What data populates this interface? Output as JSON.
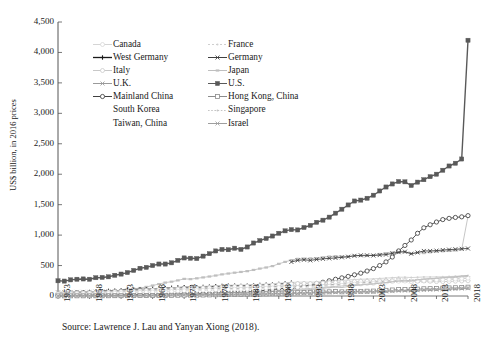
{
  "chart_data": {
    "type": "line",
    "title": "",
    "xlabel": "",
    "ylabel": "US$ billion, in 2016 prices",
    "xlim": [
      1953,
      2018
    ],
    "ylim": [
      0,
      4500
    ],
    "ytick_labels": [
      "0",
      "500",
      "1,000",
      "1,500",
      "2,000",
      "2,500",
      "3,000",
      "3,500",
      "4,000",
      "4,500"
    ],
    "ytick_values": [
      0,
      500,
      1000,
      1500,
      2000,
      2500,
      3000,
      3500,
      4000,
      4500
    ],
    "xtick_labels": [
      "1953",
      "1958",
      "1963",
      "1968",
      "1973",
      "1978",
      "1983",
      "1988",
      "1993",
      "1998",
      "2003",
      "2008",
      "2013",
      "2018"
    ],
    "xtick_values": [
      1953,
      1958,
      1963,
      1968,
      1973,
      1978,
      1983,
      1988,
      1993,
      1998,
      2003,
      2008,
      2013,
      2018
    ],
    "grid": false,
    "legend_position": "upper-left-inside",
    "x": [
      1953,
      1954,
      1955,
      1956,
      1957,
      1958,
      1959,
      1960,
      1961,
      1962,
      1963,
      1964,
      1965,
      1966,
      1967,
      1968,
      1969,
      1970,
      1971,
      1972,
      1973,
      1974,
      1975,
      1976,
      1977,
      1978,
      1979,
      1980,
      1981,
      1982,
      1983,
      1984,
      1985,
      1986,
      1987,
      1988,
      1989,
      1990,
      1991,
      1992,
      1993,
      1994,
      1995,
      1996,
      1997,
      1998,
      1999,
      2000,
      2001,
      2002,
      2003,
      2004,
      2005,
      2006,
      2007,
      2008,
      2009,
      2010,
      2011,
      2012,
      2013,
      2014,
      2015,
      2016,
      2017,
      2018
    ],
    "series": [
      {
        "name": "U.S.",
        "marker": "filled-square",
        "color": "#595959",
        "values": [
          250,
          245,
          265,
          275,
          280,
          275,
          300,
          305,
          315,
          340,
          360,
          385,
          420,
          455,
          470,
          500,
          525,
          525,
          545,
          585,
          625,
          620,
          615,
          655,
          695,
          740,
          765,
          760,
          785,
          765,
          805,
          870,
          910,
          945,
          985,
          1030,
          1070,
          1090,
          1085,
          1125,
          1160,
          1210,
          1245,
          1295,
          1360,
          1425,
          1495,
          1560,
          1575,
          1605,
          1655,
          1725,
          1790,
          1840,
          1880,
          1875,
          1815,
          1870,
          1910,
          1960,
          2000,
          2065,
          2135,
          2180,
          2250,
          4200
        ]
      },
      {
        "name": "Japan",
        "marker": "light-dash",
        "color": "#bfbfbf",
        "values": [
          30,
          34,
          38,
          43,
          48,
          52,
          59,
          68,
          78,
          86,
          96,
          109,
          118,
          131,
          149,
          172,
          196,
          220,
          235,
          256,
          281,
          277,
          290,
          305,
          320,
          336,
          355,
          369,
          383,
          395,
          408,
          428,
          450,
          468,
          491,
          528,
          560,
          590,
          610,
          615,
          618,
          622,
          635,
          648,
          655,
          648,
          648,
          662,
          658,
          660,
          672,
          690,
          702,
          715,
          730,
          720,
          690,
          710,
          705,
          718,
          730,
          735,
          740,
          748,
          765,
          1310
        ]
      },
      {
        "name": "Mainland China",
        "marker": "open-circle",
        "color": "#404040",
        "values": [
          11,
          12,
          13,
          15,
          16,
          16,
          17,
          17,
          14,
          14,
          16,
          18,
          20,
          22,
          21,
          22,
          24,
          28,
          30,
          31,
          33,
          34,
          37,
          37,
          40,
          45,
          49,
          53,
          56,
          60,
          66,
          74,
          84,
          93,
          105,
          119,
          124,
          129,
          139,
          159,
          182,
          205,
          226,
          250,
          275,
          298,
          322,
          348,
          375,
          410,
          450,
          500,
          560,
          640,
          740,
          830,
          920,
          1030,
          1120,
          1170,
          1215,
          1255,
          1275,
          1290,
          1300,
          1320
        ]
      },
      {
        "name": "Germany",
        "marker": "x",
        "color": "#3f3f3f",
        "values": [
          null,
          null,
          null,
          null,
          null,
          null,
          null,
          null,
          null,
          null,
          null,
          null,
          null,
          null,
          null,
          null,
          null,
          null,
          null,
          null,
          null,
          null,
          null,
          null,
          null,
          null,
          null,
          null,
          null,
          null,
          null,
          null,
          null,
          null,
          null,
          null,
          null,
          560,
          585,
          595,
          585,
          600,
          610,
          618,
          625,
          635,
          645,
          660,
          668,
          668,
          665,
          672,
          680,
          700,
          720,
          728,
          695,
          715,
          740,
          740,
          745,
          755,
          762,
          768,
          775,
          780
        ]
      },
      {
        "name": "West Germany",
        "marker": "plus",
        "color": "#1a1a1a",
        "values": [
          45,
          50,
          56,
          60,
          64,
          66,
          72,
          79,
          84,
          88,
          92,
          99,
          105,
          108,
          108,
          114,
          122,
          130,
          134,
          139,
          144,
          145,
          143,
          149,
          154,
          159,
          166,
          168,
          169,
          167,
          171,
          177,
          182,
          186,
          189,
          196,
          206,
          218,
          null,
          null,
          null,
          null,
          null,
          null,
          null,
          null,
          null,
          null,
          null,
          null,
          null,
          null,
          null,
          null,
          null,
          null,
          null,
          null,
          null,
          null,
          null,
          null,
          null,
          null,
          null,
          null
        ]
      },
      {
        "name": "U.K.",
        "marker": "x",
        "color": "#9a9a9a",
        "values": [
          60,
          63,
          66,
          67,
          68,
          68,
          71,
          75,
          77,
          78,
          82,
          87,
          90,
          92,
          94,
          98,
          100,
          103,
          105,
          110,
          118,
          116,
          115,
          118,
          121,
          126,
          130,
          127,
          125,
          128,
          133,
          136,
          141,
          147,
          153,
          161,
          164,
          165,
          162,
          162,
          166,
          173,
          178,
          183,
          190,
          196,
          202,
          210,
          215,
          220,
          229,
          235,
          243,
          250,
          256,
          253,
          243,
          246,
          250,
          254,
          260,
          268,
          275,
          280,
          288,
          292
        ]
      },
      {
        "name": "France",
        "marker": "light-dot",
        "color": "#d0d0d0",
        "values": [
          52,
          55,
          59,
          63,
          67,
          69,
          71,
          76,
          80,
          85,
          89,
          95,
          99,
          104,
          109,
          114,
          122,
          128,
          134,
          140,
          148,
          152,
          152,
          158,
          163,
          168,
          174,
          178,
          180,
          182,
          184,
          187,
          191,
          196,
          201,
          210,
          218,
          224,
          226,
          228,
          226,
          231,
          236,
          240,
          246,
          254,
          262,
          270,
          275,
          278,
          281,
          288,
          294,
          301,
          308,
          309,
          303,
          307,
          313,
          312,
          314,
          317,
          320,
          324,
          330,
          336
        ]
      },
      {
        "name": "Italy",
        "marker": "light-circle",
        "color": "#c8c8c8",
        "values": [
          38,
          41,
          44,
          47,
          50,
          52,
          56,
          61,
          65,
          69,
          74,
          76,
          80,
          85,
          91,
          97,
          103,
          109,
          110,
          114,
          122,
          128,
          125,
          133,
          136,
          141,
          150,
          155,
          156,
          157,
          160,
          164,
          169,
          174,
          179,
          187,
          194,
          199,
          203,
          206,
          204,
          209,
          215,
          218,
          222,
          226,
          229,
          237,
          241,
          242,
          242,
          246,
          248,
          253,
          258,
          255,
          241,
          245,
          247,
          241,
          236,
          236,
          239,
          243,
          247,
          250
        ]
      },
      {
        "name": "Canada",
        "marker": "open-circle-light",
        "color": "#dcdcdc",
        "values": [
          29,
          29,
          32,
          35,
          36,
          37,
          39,
          40,
          42,
          45,
          47,
          51,
          55,
          59,
          61,
          65,
          69,
          71,
          74,
          79,
          86,
          88,
          89,
          95,
          98,
          102,
          106,
          108,
          112,
          109,
          112,
          119,
          124,
          128,
          133,
          140,
          144,
          144,
          141,
          142,
          145,
          153,
          157,
          160,
          168,
          175,
          185,
          195,
          197,
          203,
          207,
          217,
          228,
          237,
          242,
          245,
          238,
          246,
          254,
          259,
          265,
          272,
          275,
          279,
          288,
          293
        ]
      },
      {
        "name": "South Korea",
        "marker": "plain-gray",
        "color": "#b8b8b8",
        "values": [
          4,
          4,
          5,
          5,
          5,
          6,
          6,
          6,
          6,
          7,
          8,
          8,
          9,
          10,
          11,
          12,
          13,
          14,
          15,
          16,
          18,
          20,
          21,
          24,
          27,
          31,
          34,
          33,
          36,
          39,
          43,
          48,
          52,
          57,
          64,
          72,
          79,
          88,
          93,
          99,
          105,
          116,
          127,
          138,
          147,
          139,
          155,
          172,
          180,
          193,
          198,
          209,
          219,
          232,
          244,
          250,
          252,
          268,
          278,
          285,
          292,
          301,
          309,
          316,
          327,
          337
        ]
      },
      {
        "name": "Taiwan, China",
        "marker": "plain-gray2",
        "color": "#c2c2c2",
        "values": [
          4,
          4,
          5,
          5,
          5,
          6,
          6,
          7,
          7,
          8,
          9,
          10,
          11,
          12,
          13,
          14,
          16,
          17,
          19,
          22,
          25,
          26,
          28,
          32,
          35,
          40,
          44,
          47,
          49,
          51,
          55,
          61,
          63,
          70,
          79,
          87,
          94,
          100,
          108,
          116,
          124,
          133,
          141,
          150,
          158,
          165,
          176,
          188,
          184,
          192,
          199,
          213,
          223,
          235,
          248,
          246,
          242,
          265,
          273,
          280,
          288,
          298,
          301,
          306,
          315,
          323
        ]
      },
      {
        "name": "Hong Kong, China",
        "marker": "open-square",
        "color": "#8c8c8c",
        "values": [
          2,
          2,
          3,
          3,
          3,
          3,
          4,
          4,
          4,
          5,
          5,
          6,
          7,
          7,
          7,
          8,
          9,
          10,
          11,
          12,
          14,
          14,
          14,
          16,
          18,
          20,
          22,
          24,
          26,
          27,
          29,
          32,
          32,
          36,
          41,
          45,
          49,
          51,
          54,
          57,
          60,
          64,
          66,
          69,
          73,
          69,
          71,
          76,
          76,
          79,
          81,
          88,
          93,
          99,
          106,
          108,
          105,
          113,
          119,
          121,
          125,
          129,
          133,
          136,
          141,
          145
        ]
      },
      {
        "name": "Singapore",
        "marker": "dotted",
        "color": "#c5c5c5",
        "values": [
          1,
          1,
          1,
          1,
          1,
          2,
          2,
          2,
          2,
          2,
          3,
          3,
          3,
          3,
          4,
          4,
          5,
          5,
          6,
          7,
          8,
          8,
          9,
          9,
          10,
          11,
          12,
          13,
          14,
          15,
          16,
          17,
          17,
          18,
          20,
          23,
          25,
          27,
          29,
          32,
          35,
          39,
          42,
          45,
          49,
          47,
          50,
          55,
          54,
          56,
          60,
          66,
          71,
          78,
          86,
          87,
          86,
          101,
          109,
          114,
          120,
          125,
          128,
          132,
          139,
          145
        ]
      },
      {
        "name": "Israel",
        "marker": "x-small",
        "color": "#9e9e9e",
        "values": [
          3,
          3,
          4,
          4,
          5,
          5,
          6,
          6,
          7,
          8,
          8,
          9,
          10,
          10,
          11,
          13,
          14,
          15,
          17,
          19,
          20,
          21,
          22,
          23,
          23,
          24,
          26,
          27,
          28,
          29,
          30,
          31,
          32,
          34,
          37,
          38,
          39,
          41,
          44,
          47,
          49,
          52,
          56,
          59,
          61,
          63,
          65,
          69,
          68,
          68,
          69,
          72,
          76,
          80,
          85,
          88,
          89,
          94,
          99,
          101,
          105,
          109,
          112,
          116,
          121,
          126
        ]
      }
    ]
  },
  "legend": {
    "rows": [
      [
        {
          "label": "Canada",
          "key": "open-circle-light",
          "color": "#d5d5d5"
        },
        {
          "label": "France",
          "key": "light-dot",
          "color": "#cfcfcf"
        }
      ],
      [
        {
          "label": "West Germany",
          "key": "plus",
          "color": "#1a1a1a"
        },
        {
          "label": "Germany",
          "key": "x",
          "color": "#3f3f3f"
        }
      ],
      [
        {
          "label": "Italy",
          "key": "light-circle",
          "color": "#c8c8c8"
        },
        {
          "label": "Japan",
          "key": "light-dash",
          "color": "#bfbfbf"
        }
      ],
      [
        {
          "label": "U.K.",
          "key": "x",
          "color": "#9a9a9a"
        },
        {
          "label": "U.S.",
          "key": "filled-square",
          "color": "#595959"
        }
      ],
      [
        {
          "label": "Mainland China",
          "key": "open-circle",
          "color": "#404040"
        },
        {
          "label": "Hong Kong, China",
          "key": "open-square",
          "color": "#8c8c8c"
        }
      ],
      [
        {
          "label": "South Korea",
          "key": "plain-gray",
          "color": "#b8b8b8"
        },
        {
          "label": "Singapore",
          "key": "dotted",
          "color": "#c5c5c5"
        }
      ],
      [
        {
          "label": "Taiwan, China",
          "key": "plain-gray2",
          "color": "#c2c2c2"
        },
        {
          "label": "Israel",
          "key": "x-small",
          "color": "#9e9e9e"
        }
      ]
    ]
  },
  "caption": {
    "source": "Source: Lawrence J. Lau and Yanyan Xiong (2018)."
  },
  "colors": {
    "axis": "#555555",
    "text": "#1a1a1a",
    "background": "#ffffff"
  }
}
